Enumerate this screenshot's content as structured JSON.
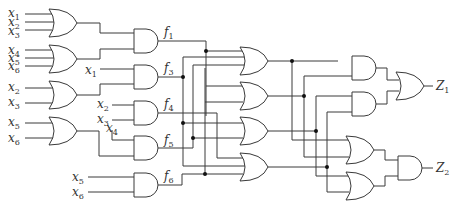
{
  "diagram": {
    "type": "combinational-logic-circuit",
    "inputs": [
      {
        "name": "x",
        "sub": "1"
      },
      {
        "name": "x",
        "sub": "2"
      },
      {
        "name": "x",
        "sub": "3"
      },
      {
        "name": "x",
        "sub": "4"
      },
      {
        "name": "x",
        "sub": "5"
      },
      {
        "name": "x",
        "sub": "6"
      }
    ],
    "labels": {
      "in1a": {
        "base": "x",
        "sub": "1"
      },
      "in1b": {
        "base": "x",
        "sub": "2"
      },
      "in1c": {
        "base": "x",
        "sub": "3"
      },
      "in2a": {
        "base": "x",
        "sub": "4"
      },
      "in2b": {
        "base": "x",
        "sub": "5"
      },
      "in2c": {
        "base": "x",
        "sub": "6"
      },
      "in_f3": {
        "base": "x",
        "sub": "1"
      },
      "in3a": {
        "base": "x",
        "sub": "2"
      },
      "in3b": {
        "base": "x",
        "sub": "3"
      },
      "in_f4a": {
        "base": "x",
        "sub": "2"
      },
      "in_f4b": {
        "base": "x",
        "sub": "3"
      },
      "in4a": {
        "base": "x",
        "sub": "5"
      },
      "in4b": {
        "base": "x",
        "sub": "6"
      },
      "in_f5": {
        "base": "x",
        "sub": "4"
      },
      "in_f6a": {
        "base": "x",
        "sub": "5"
      },
      "in_f6b": {
        "base": "x",
        "sub": "6"
      },
      "f1": {
        "base": "f",
        "sub": "1"
      },
      "f3": {
        "base": "f",
        "sub": "3"
      },
      "f4": {
        "base": "f",
        "sub": "4"
      },
      "f5": {
        "base": "f",
        "sub": "5"
      },
      "f6": {
        "base": "f",
        "sub": "6"
      },
      "z1": {
        "base": "Z",
        "sub": "1"
      },
      "z2": {
        "base": "Z",
        "sub": "2"
      }
    },
    "gates": {
      "column1": [
        "OR(x1,x2,x3)",
        "OR(x4,x5,x6)",
        "OR(x2,x3)",
        "OR(x5,x6)"
      ],
      "column2": [
        "AND -> f1",
        "AND(x1, ...) -> f3",
        "AND(x2,x3) -> f4",
        "AND(x4, ...) -> f5",
        "AND(x5,x6) -> f6"
      ],
      "column3": [
        "OR",
        "OR",
        "OR",
        "OR"
      ],
      "column4": [
        "AND",
        "AND",
        "OR",
        "OR"
      ],
      "outputs": [
        "OR -> Z1",
        "AND -> Z2"
      ]
    }
  }
}
